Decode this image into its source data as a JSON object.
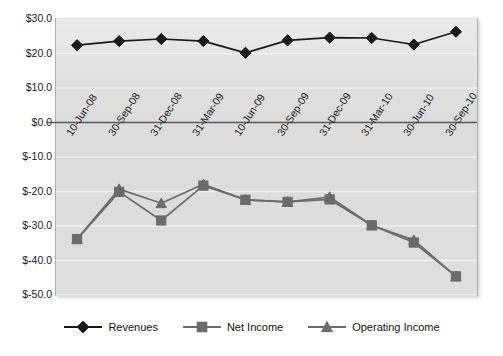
{
  "chart_data": {
    "type": "line",
    "title": "",
    "subtitle": "",
    "xlabel": "",
    "ylabel": "",
    "ylim": [
      -50.0,
      30.0
    ],
    "ytick_step": 10.0,
    "grid": true,
    "grid_axis": "y",
    "legend_position": "bottom",
    "currency_prefix": "$",
    "categories": [
      "10-Jun-08",
      "30-Sep-08",
      "31-Dec-08",
      "31-Mar-09",
      "10-Jun-09",
      "30-Sep-09",
      "31-Dec-09",
      "31-Mar-10",
      "30-Jun-10",
      "30-Sep-10"
    ],
    "ytick_labels": [
      "$30.0",
      "$20.0",
      "$10.0",
      "$0.0",
      "$-10.0",
      "$-20.0",
      "$-30.0",
      "$-40.0",
      "$-50.0"
    ],
    "ytick_values": [
      30.0,
      20.0,
      10.0,
      0.0,
      -10.0,
      -20.0,
      -30.0,
      -40.0,
      -50.0
    ],
    "series": [
      {
        "name": "Revenues",
        "marker": "diamond",
        "color": "#1a1a1a",
        "values": [
          22.4,
          23.6,
          24.2,
          23.6,
          20.2,
          23.8,
          24.6,
          24.5,
          22.6,
          26.3
        ]
      },
      {
        "name": "Net Income",
        "marker": "square",
        "color": "#6b6b6b",
        "values": [
          -33.8,
          -20.1,
          -28.4,
          -18.3,
          -22.4,
          -23.0,
          -22.3,
          -29.8,
          -34.8,
          -44.6
        ]
      },
      {
        "name": "Operating Income",
        "marker": "triangle",
        "color": "#6b6b6b",
        "values": [
          -33.8,
          -19.3,
          -23.4,
          -17.9,
          -22.4,
          -23.0,
          -21.6,
          -29.8,
          -34.1,
          -44.6
        ]
      }
    ]
  },
  "legend": {
    "items": [
      {
        "label": "Revenues",
        "marker": "diamond-marker",
        "color": "#1a1a1a"
      },
      {
        "label": "Net Income",
        "marker": "square-marker",
        "color": "#6b6b6b"
      },
      {
        "label": "Operating Income",
        "marker": "triangle-marker",
        "color": "#6b6b6b"
      }
    ]
  },
  "colors": {
    "plot_background": "#dcdcdc",
    "page_background": "#ffffff",
    "gridline": "#f2f2f2",
    "zero_axis": "#5a5a5a",
    "revenues": "#1a1a1a",
    "net_income": "#6b6b6b",
    "operating_income": "#6b6b6b"
  },
  "bottom_caption": {
    "text": ""
  }
}
